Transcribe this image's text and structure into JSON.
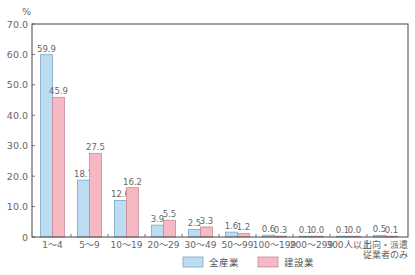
{
  "chart_data": {
    "type": "bar",
    "title": "",
    "xlabel": "",
    "ylabel": "%",
    "ylim": [
      0,
      70
    ],
    "yticks": [
      "0",
      "10.0",
      "20.0",
      "30.0",
      "40.0",
      "50.0",
      "60.0",
      "70.0"
    ],
    "grid": false,
    "legend_position": "bottom",
    "categories": [
      "1～4",
      "5～9",
      "10～19",
      "20～29",
      "30～49",
      "50～99",
      "100～199",
      "200～299",
      "300人以上",
      "出向・派遣従業者のみ"
    ],
    "category_lines": [
      [
        "1～4"
      ],
      [
        "5～9"
      ],
      [
        "10～19"
      ],
      [
        "20～29"
      ],
      [
        "30～49"
      ],
      [
        "50～99"
      ],
      [
        "100～199"
      ],
      [
        "200～299"
      ],
      [
        "300人以上"
      ],
      [
        "出向・派遣",
        "従業者のみ"
      ]
    ],
    "series": [
      {
        "name": "全産業",
        "color": "#bcdcf2",
        "values": [
          59.9,
          18.7,
          12.0,
          3.9,
          2.5,
          1.6,
          0.6,
          0.1,
          0.1,
          0.5
        ],
        "labels": [
          "59.9",
          "18.7",
          "12.0",
          "3.9",
          "2.5",
          "1.6",
          "0.6",
          "0.1",
          "0.1",
          "0.5"
        ]
      },
      {
        "name": "建設業",
        "color": "#f6b8c2",
        "values": [
          45.9,
          27.5,
          16.2,
          5.5,
          3.3,
          1.2,
          0.3,
          0.0,
          0.0,
          0.1
        ],
        "labels": [
          "45.9",
          "27.5",
          "16.2",
          "5.5",
          "3.3",
          "1.2",
          "0.3",
          "0.0",
          "0.0",
          "0.1"
        ]
      }
    ]
  }
}
